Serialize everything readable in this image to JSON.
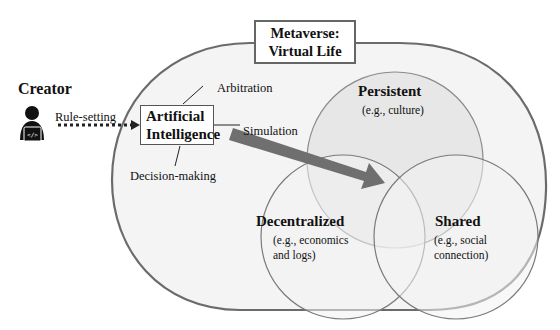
{
  "diagram": {
    "title": {
      "line1": "Metaverse:",
      "line2": "Virtual Life"
    },
    "creator": {
      "label": "Creator",
      "icon": "person-at-laptop-icon"
    },
    "edges": {
      "rule_setting": "Rule-setting",
      "arbitration": "Arbitration",
      "simulation": "Simulation",
      "decision_making": "Decision-making"
    },
    "ai_box": {
      "line1": "Artificial",
      "line2": "Intelligence"
    },
    "circles": [
      {
        "name": "Persistent",
        "example": "(e.g., culture)"
      },
      {
        "name": "Decentralized",
        "example": "(e.g., economics and logs)"
      },
      {
        "name": "Shared",
        "example": "(e.g., social connection)"
      }
    ],
    "colors": {
      "outer_fill": "#f4f4f4",
      "outline": "#6b6b6b",
      "persistent_fill": "#e6e6e6",
      "arrow": "#6f6f6f",
      "background": "#ffffff"
    }
  }
}
